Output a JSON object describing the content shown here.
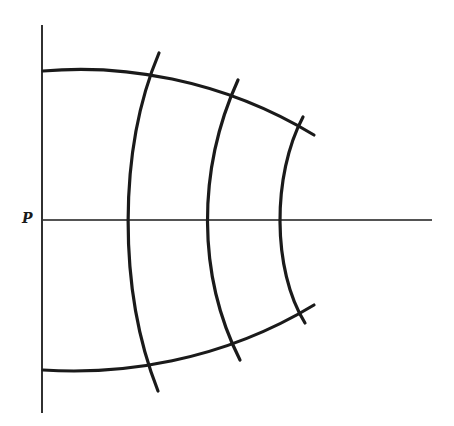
{
  "diagram": {
    "type": "curvilinear-grid-wavefronts",
    "point_label": "P",
    "colors": {
      "stroke": "#1a1a1a",
      "background": "#ffffff"
    },
    "axes": {
      "vertical": {
        "x": 42,
        "y1": 25,
        "y2": 413
      },
      "horizontal": {
        "y": 220,
        "x1": 43,
        "x2": 432
      }
    },
    "boundary_curves": [
      {
        "name": "upper-boundary",
        "d": "M43,71 C120,64 220,78 314,135"
      },
      {
        "name": "lower-boundary",
        "d": "M43,370 C120,375 220,362 314,305"
      }
    ],
    "wavefront_arcs": [
      {
        "name": "arc-1",
        "axis_x": 127,
        "d": "M159,53 C118,150 118,290 158,391"
      },
      {
        "name": "arc-2",
        "axis_x": 207,
        "d": "M238,80 C197,170 197,275 240,360"
      },
      {
        "name": "arc-3",
        "axis_x": 280,
        "d": "M303,117 C272,175 272,270 305,323"
      }
    ]
  }
}
